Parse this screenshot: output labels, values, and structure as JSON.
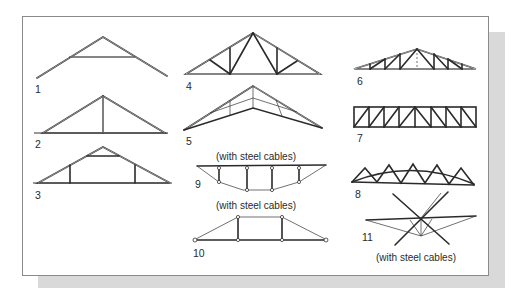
{
  "figure": {
    "type": "truss-types-illustration",
    "colors": {
      "background": "#ffffff",
      "frame_border": "#8a8a8a",
      "shadow": "#d9d9d9",
      "ink": "#2a2a2a"
    },
    "trusses": [
      {
        "id": 1,
        "label": "1",
        "caption": ""
      },
      {
        "id": 2,
        "label": "2",
        "caption": ""
      },
      {
        "id": 3,
        "label": "3",
        "caption": ""
      },
      {
        "id": 4,
        "label": "4",
        "caption": ""
      },
      {
        "id": 5,
        "label": "5",
        "caption": ""
      },
      {
        "id": 6,
        "label": "6",
        "caption": ""
      },
      {
        "id": 7,
        "label": "7",
        "caption": ""
      },
      {
        "id": 8,
        "label": "8",
        "caption": ""
      },
      {
        "id": 9,
        "label": "9",
        "caption": "(with steel cables)"
      },
      {
        "id": 10,
        "label": "10",
        "caption": "(with steel cables)"
      },
      {
        "id": 11,
        "label": "11",
        "caption": "(with steel cables)"
      }
    ]
  }
}
